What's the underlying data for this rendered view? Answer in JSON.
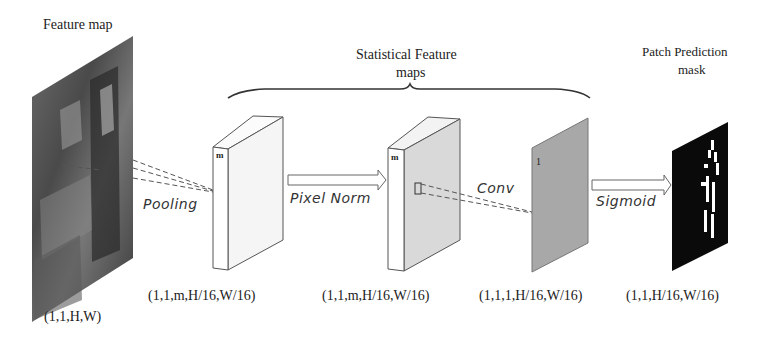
{
  "diagram": {
    "title_labels": {
      "feature_map": "Feature map",
      "statistical_line1": "Statistical Feature",
      "statistical_line2": "maps",
      "patch_line1": "Patch Prediction",
      "patch_line2": "mask"
    },
    "operations": {
      "pooling": "Pooling",
      "pixel_norm": "Pixel Norm",
      "conv": "Conv",
      "sigmoid": "Sigmoid"
    },
    "channel_labels": {
      "pooled_map": "m",
      "normed_map": "m",
      "conv_map": "1"
    },
    "shapes": {
      "input": "(1,1,H,W)",
      "pooled": "(1,1,m,H/16,W/16)",
      "normed": "(1,1,m,H/16,W/16)",
      "conv_out": "(1,1,1,H/16,W/16)",
      "mask": "(1,1,H/16,W/16)"
    },
    "colors": {
      "box_face": "#f7f7f7",
      "normed_face": "#d9d9d9",
      "conv_plane": "#a8a8a8",
      "mask": "#0a0a0a",
      "line": "#444444"
    }
  }
}
